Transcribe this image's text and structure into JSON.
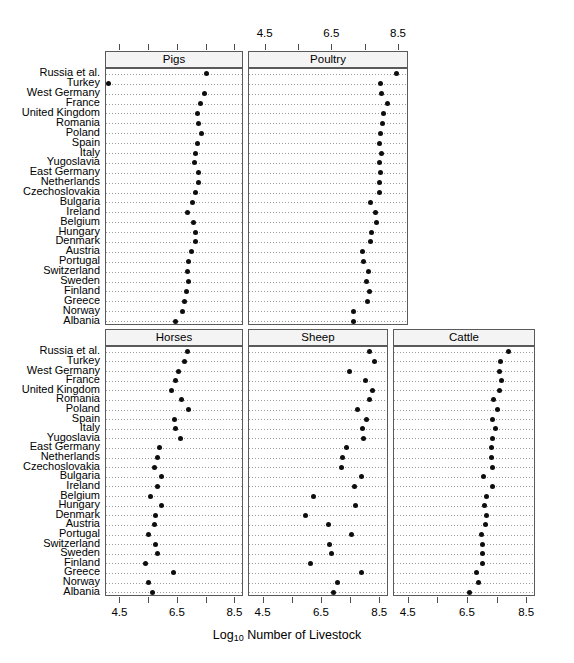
{
  "chart_data": {
    "type": "scatter",
    "plot_style": "cleveland-dot-plot",
    "title": "",
    "xlabel_prefix": "Log",
    "xlabel_sub": "10",
    "xlabel_suffix": " Number of Livestock",
    "ylabel": "",
    "xlim": [
      4.0,
      8.8
    ],
    "xticks": [
      4.5,
      5.5,
      6.5,
      7.5,
      8.5
    ],
    "xtick_labels": [
      "4.5",
      "",
      "6.5",
      "",
      "8.5"
    ],
    "xtick_labels_top": [
      "4.5",
      "",
      "6.5",
      "",
      "8.5"
    ],
    "grid": true,
    "grid_style": "dotted-rows",
    "legend": "none",
    "categories": [
      "Russia et al.",
      "Turkey",
      "West Germany",
      "France",
      "United Kingdom",
      "Romania",
      "Poland",
      "Spain",
      "Italy",
      "Yugoslavia",
      "East Germany",
      "Netherlands",
      "Czechoslovakia",
      "Bulgaria",
      "Ireland",
      "Belgium",
      "Hungary",
      "Denmark",
      "Austria",
      "Portugal",
      "Switzerland",
      "Sweden",
      "Finland",
      "Greece",
      "Norway",
      "Albania"
    ],
    "panels": [
      {
        "name": "Pigs",
        "row": 0,
        "col": 0,
        "axis_side": "top",
        "values": [
          7.5,
          4.1,
          7.41,
          7.3,
          7.18,
          7.2,
          7.33,
          7.18,
          7.1,
          7.08,
          7.2,
          7.22,
          7.13,
          7.0,
          6.82,
          7.03,
          7.13,
          7.13,
          6.97,
          6.88,
          6.85,
          6.87,
          6.79,
          6.72,
          6.65,
          6.43
        ]
      },
      {
        "name": "Poultry",
        "row": 0,
        "col": 1,
        "axis_side": "top",
        "values": [
          8.43,
          7.93,
          7.98,
          8.14,
          8.02,
          8.0,
          7.95,
          7.9,
          7.98,
          7.92,
          7.95,
          7.9,
          7.92,
          7.63,
          7.78,
          7.82,
          7.68,
          7.63,
          7.4,
          7.43,
          7.57,
          7.53,
          7.62,
          7.55,
          7.12,
          7.12
        ]
      },
      {
        "name": "Horses",
        "row": 1,
        "col": 0,
        "axis_side": "bottom",
        "values": [
          6.85,
          6.72,
          6.53,
          6.43,
          6.27,
          6.62,
          6.88,
          6.38,
          6.4,
          6.6,
          5.87,
          5.78,
          5.7,
          5.92,
          5.8,
          5.55,
          5.92,
          5.73,
          5.68,
          5.48,
          5.72,
          5.78,
          5.38,
          6.35,
          5.47,
          5.62
        ]
      },
      {
        "name": "Sheep",
        "row": 1,
        "col": 1,
        "axis_side": "bottom",
        "values": [
          8.12,
          8.3,
          7.43,
          8.0,
          8.22,
          8.12,
          7.72,
          8.03,
          7.9,
          7.93,
          7.33,
          7.22,
          7.18,
          7.85,
          7.63,
          6.22,
          7.65,
          5.93,
          6.72,
          7.52,
          6.75,
          6.82,
          6.1,
          7.87,
          7.02,
          6.88
        ]
      },
      {
        "name": "Cattle",
        "row": 1,
        "col": 2,
        "axis_side": "bottom",
        "values": [
          7.88,
          7.6,
          7.58,
          7.62,
          7.55,
          7.38,
          7.5,
          7.33,
          7.42,
          7.32,
          7.3,
          7.3,
          7.32,
          7.02,
          7.33,
          7.13,
          7.05,
          7.13,
          7.1,
          6.97,
          7.0,
          7.0,
          6.98,
          6.78,
          6.87,
          6.55
        ]
      }
    ],
    "axis_top_visible_panels": [
      "Poultry"
    ],
    "axis_bottom_visible_panels": [
      "Horses",
      "Sheep",
      "Cattle"
    ]
  },
  "figure": {
    "background": "#ffffff",
    "dot_color": "#0d0d0d",
    "panel_border": "#5a5a5a",
    "strip_background": "#f4f4f4",
    "grid_color": "#9a9a9a"
  }
}
